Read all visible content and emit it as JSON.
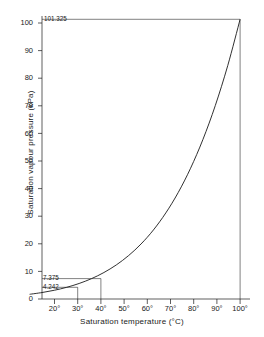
{
  "chart_data": {
    "type": "line",
    "title": "",
    "xlabel": "Saturation temperature (°C)",
    "ylabel": "Saturation vapour pressure (kPa)",
    "xlim": [
      15,
      103
    ],
    "ylim": [
      0,
      103
    ],
    "grid": false,
    "legend": "none",
    "xticks": [
      20,
      30,
      40,
      50,
      60,
      70,
      80,
      90,
      100
    ],
    "xtick_labels": [
      "20°",
      "30°",
      "40°",
      "50°",
      "60°",
      "70°",
      "80°",
      "90°",
      "100°"
    ],
    "yticks": [
      0,
      10,
      20,
      30,
      40,
      50,
      60,
      70,
      80,
      90,
      100
    ],
    "ytick_labels": [
      "0",
      "10",
      "20",
      "30",
      "40",
      "50",
      "60",
      "70",
      "80",
      "90",
      "100"
    ],
    "series": [
      {
        "name": "Saturation vapour pressure of water",
        "x": [
          15,
          20,
          25,
          30,
          35,
          40,
          45,
          50,
          55,
          60,
          65,
          70,
          75,
          80,
          85,
          90,
          95,
          100
        ],
        "y": [
          1.705,
          2.339,
          3.169,
          4.242,
          5.627,
          7.375,
          9.593,
          12.34,
          15.75,
          19.93,
          25.01,
          31.18,
          38.56,
          47.37,
          57.82,
          70.12,
          84.53,
          101.325
        ]
      }
    ],
    "annotations": [
      {
        "label": "101.325",
        "x": 100,
        "y": 101.325,
        "leader": "horizontal-to-curve-plus-vertical"
      },
      {
        "label": "7.375",
        "x": 40,
        "y": 7.375,
        "leader": "horizontal-to-curve-plus-vertical"
      },
      {
        "label": "4.242",
        "x": 30,
        "y": 4.242,
        "leader": "horizontal-to-curve-plus-vertical"
      }
    ],
    "line_color": "#1a1a1a",
    "axis_color": "#1a1a1a",
    "background_color": "#ffffff"
  },
  "axes": {
    "x_title": "Saturation temperature (°C)",
    "y_title": "Saturation vapour pressure  (kPa)"
  },
  "y_ticks": [
    {
      "label": "100"
    },
    {
      "label": "90"
    },
    {
      "label": "80"
    },
    {
      "label": "70"
    },
    {
      "label": "60"
    },
    {
      "label": "50"
    },
    {
      "label": "40"
    },
    {
      "label": "30"
    },
    {
      "label": "20"
    },
    {
      "label": "10"
    },
    {
      "label": "0"
    }
  ],
  "x_ticks": [
    {
      "label": "20°"
    },
    {
      "label": "30°"
    },
    {
      "label": "40°"
    },
    {
      "label": "50°"
    },
    {
      "label": "60°"
    },
    {
      "label": "70°"
    },
    {
      "label": "80°"
    },
    {
      "label": "90°"
    },
    {
      "label": "100°"
    }
  ],
  "annotations": {
    "atmospheric": "101.325",
    "at_forty": "7.375",
    "at_thirty": "4.242"
  }
}
